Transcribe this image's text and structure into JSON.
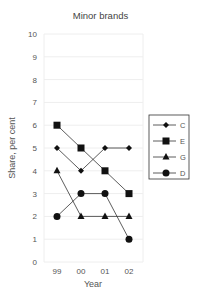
{
  "chart_data": {
    "type": "line",
    "title": "Minor brands",
    "xlabel": "Year",
    "ylabel": "Share, per cent",
    "categories": [
      "99",
      "00",
      "01",
      "02"
    ],
    "ylim": [
      0,
      10
    ],
    "yticks": [
      0,
      1,
      2,
      3,
      4,
      5,
      6,
      7,
      8,
      9,
      10
    ],
    "grid": true,
    "legend_position": "right",
    "series": [
      {
        "name": "C",
        "marker": "diamond",
        "values": [
          5,
          4,
          5,
          5
        ]
      },
      {
        "name": "E",
        "marker": "square",
        "values": [
          6,
          5,
          4,
          3
        ]
      },
      {
        "name": "G",
        "marker": "triangle",
        "values": [
          4,
          2,
          2,
          2
        ]
      },
      {
        "name": "D",
        "marker": "circle",
        "values": [
          2,
          3,
          3,
          1
        ]
      }
    ],
    "colors": {
      "line": "#333333",
      "marker": "#111111",
      "grid": "#eeeeee",
      "axis_text": "#555555"
    }
  }
}
